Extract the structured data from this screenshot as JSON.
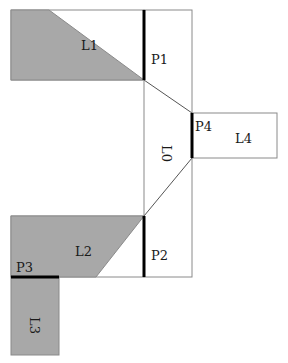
{
  "colors": {
    "fill": "#a8a8a8",
    "outline": "#8a8a8a",
    "port": "#000000",
    "background": "#ffffff"
  },
  "labels": {
    "l0": "L0",
    "l1": "L1",
    "l2": "L2",
    "l3": "L3",
    "l4": "L4",
    "p1": "P1",
    "p2": "P2",
    "p3": "P3",
    "p4": "P4"
  }
}
